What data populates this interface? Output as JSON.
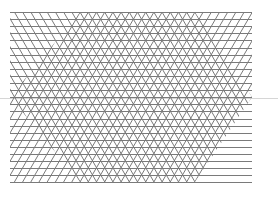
{
  "figure": {
    "width": 278,
    "height": 205,
    "background": "#ffffff",
    "line_color": "#7a7a7a",
    "line_width": 1,
    "region": {
      "x0": 10,
      "y0": 12,
      "x1": 252,
      "y1": 182
    },
    "horizontal": {
      "spacing": 7.1,
      "count": 25
    },
    "diagonals": {
      "spacing": 8.2,
      "dx_per_dy": 0.58
    },
    "hexagon": {
      "top_left_x": 80,
      "top_right_x": 195,
      "mid_y": 97,
      "bottom_left_x": 80,
      "bottom_right_x": 195
    },
    "separator": {
      "y": 98,
      "color": "#d6d6d6"
    }
  }
}
